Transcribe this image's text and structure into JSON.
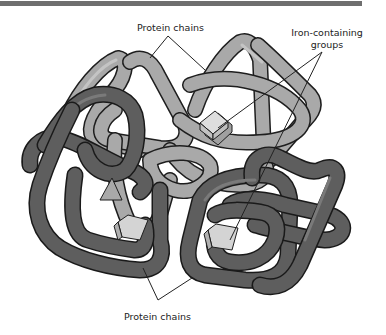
{
  "figure": {
    "type": "molecular-structure-illustration",
    "colors": {
      "light_chain": "#a9a9a9",
      "dark_chain": "#5e5e5e",
      "outline": "#1e1e1e",
      "iron_group": "#cfcfcf",
      "top_bar": "#6f6f6f"
    }
  },
  "labels": {
    "top_protein_chains": "Protein chains",
    "iron_groups_line1": "Iron-containing",
    "iron_groups_line2": "groups",
    "bottom_protein_chains": "Protein chains"
  }
}
